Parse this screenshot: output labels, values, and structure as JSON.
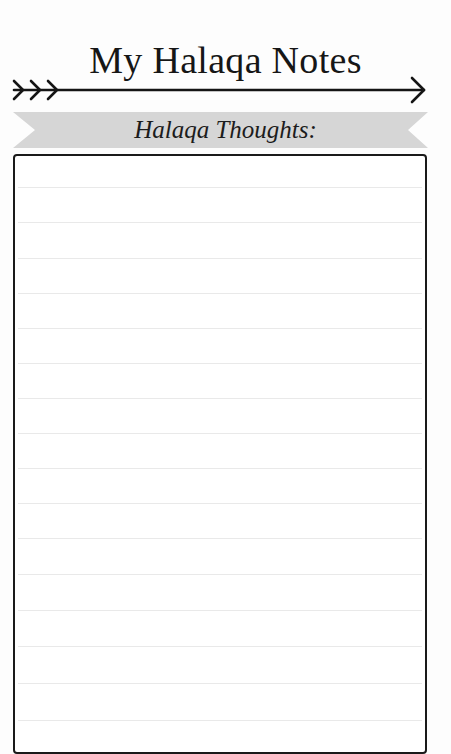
{
  "header": {
    "title": "My Halaqa Notes",
    "decoration": "arrow-icon"
  },
  "banner": {
    "label": "Halaqa Thoughts:",
    "color": "#d6d6d6"
  },
  "notes_box": {
    "border_color": "#1a1a1a",
    "rule_color": "#e9e9e9",
    "line_count": 16,
    "lines": [
      "",
      "",
      "",
      "",
      "",
      "",
      "",
      "",
      "",
      "",
      "",
      "",
      "",
      "",
      "",
      ""
    ]
  }
}
